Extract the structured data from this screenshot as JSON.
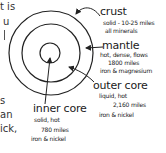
{
  "text_fragments": [
    "t is",
    "u",
    "s",
    "an",
    "ick,"
  ],
  "diagram": {
    "layers": [
      {
        "name": "crust",
        "details": [
          "solid - 10-25 miles",
          "all minerals"
        ]
      },
      {
        "name": "mantle",
        "details": [
          "hot, dense, flows",
          "1800 miles",
          "iron & magnesium"
        ]
      },
      {
        "name": "outer core",
        "details": [
          "liquid, hot",
          "2,160 miles",
          "iron & nickel"
        ]
      },
      {
        "name": "inner core",
        "details": [
          "solid, hot",
          "780 miles",
          "iron & nickel"
        ]
      }
    ]
  }
}
